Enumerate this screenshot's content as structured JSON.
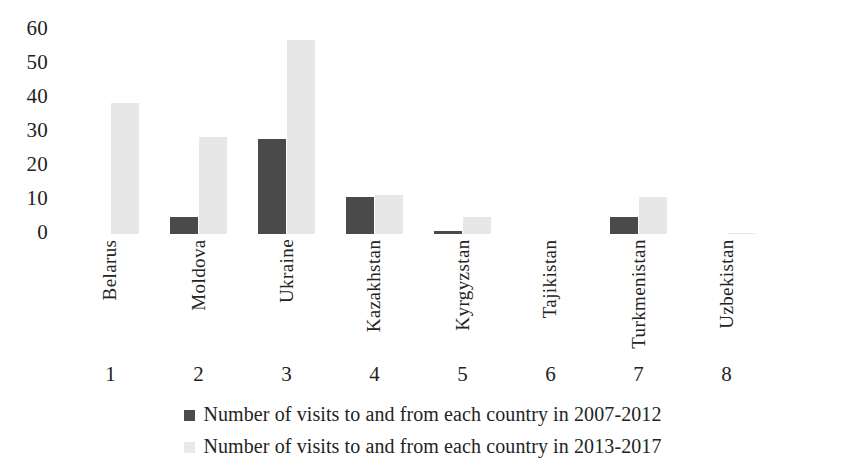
{
  "chart_data": {
    "type": "bar",
    "title": "",
    "subtitle": "",
    "xlabel": "",
    "ylabel": "",
    "ylim": [
      0,
      60
    ],
    "y_ticks": [
      "60",
      "50",
      "40",
      "30",
      "20",
      "10",
      "0"
    ],
    "grid": false,
    "legend_position": "bottom",
    "categories": [
      "Belarus",
      "Moldova",
      "Ukraine",
      "Kazakhstan",
      "Kyrgyzstan",
      "Tajikistan",
      "Turkmenistan",
      "Uzbekistan"
    ],
    "category_indices": [
      "1",
      "2",
      "3",
      "4",
      "5",
      "6",
      "7",
      "8"
    ],
    "series": [
      {
        "name": "Number of visits to and from each country in 2007-2012",
        "color": "#4a4a4a",
        "values": [
          0,
          5,
          28,
          11,
          1,
          0,
          5,
          0
        ]
      },
      {
        "name": "Number of visits to and from each country in 2013-2017",
        "color": "#e7e7e7",
        "values": [
          38.5,
          28.5,
          57,
          11.5,
          5,
          0,
          11,
          0.3
        ]
      }
    ]
  },
  "legend": {
    "items": [
      {
        "label": "Number of visits to and from each country in 2007-2012",
        "swatch": "dark"
      },
      {
        "label": "Number of visits to and from each country in 2013-2017",
        "swatch": "light"
      }
    ]
  }
}
